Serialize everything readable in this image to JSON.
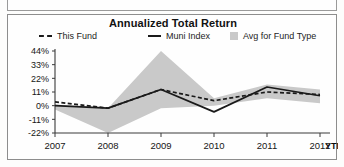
{
  "chart_data": {
    "type": "line",
    "title": "Annualized Total Return",
    "xlabel": "",
    "ylabel": "",
    "x": [
      "2007",
      "2008",
      "2009",
      "2010",
      "2011",
      "2012"
    ],
    "xtick_labels": [
      "2007",
      "2008",
      "2009",
      "2010",
      "2011",
      "2012"
    ],
    "x_axis_suffix": "YTD",
    "ytick_labels": [
      "44%",
      "33%",
      "22%",
      "11%",
      "0%",
      "-11%",
      "-22%"
    ],
    "ytick_values": [
      44,
      33,
      22,
      11,
      0,
      -11,
      -22
    ],
    "ylim": [
      -22,
      44
    ],
    "grid": false,
    "legend_position": "top",
    "series": [
      {
        "name": "This Fund",
        "style": "dashed",
        "color": "#1a1a1a",
        "values": [
          3,
          -2,
          13,
          4,
          11,
          9
        ]
      },
      {
        "name": "Muni Index",
        "style": "solid",
        "color": "#1a1a1a",
        "values": [
          0,
          -2,
          13,
          -5,
          15,
          8
        ]
      },
      {
        "name": "Avg for Fund Type",
        "style": "band",
        "color": "#c9c9c9",
        "upper": [
          1,
          -2,
          44,
          6,
          17,
          13
        ],
        "lower": [
          -3,
          -22,
          -2,
          0,
          6,
          2
        ]
      }
    ]
  },
  "legend": {
    "items": [
      {
        "label": "This Fund",
        "swatch": "dashed-line-swatch"
      },
      {
        "label": "Muni Index",
        "swatch": "solid-line-swatch"
      },
      {
        "label": "Avg for Fund Type",
        "swatch": "gray-box-swatch"
      }
    ]
  }
}
